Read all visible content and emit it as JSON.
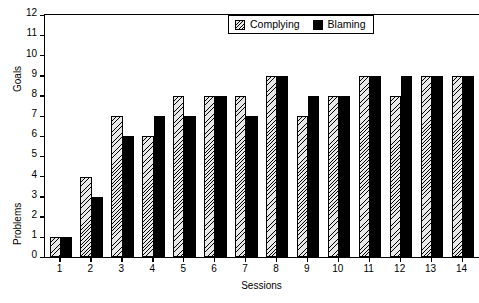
{
  "chart_data": {
    "type": "bar",
    "title": "",
    "xlabel": "Sessions",
    "ylabel": "Goals",
    "ylabel_secondary": "Problems",
    "categories": [
      "1",
      "2",
      "3",
      "4",
      "5",
      "6",
      "7",
      "8",
      "9",
      "10",
      "11",
      "12",
      "13",
      "14"
    ],
    "series": [
      {
        "name": "Complying",
        "values": [
          1,
          4,
          7,
          6,
          8,
          8,
          8,
          9,
          7,
          8,
          9,
          8,
          9,
          9
        ],
        "fill": "hatched",
        "color": "#e8e8e8"
      },
      {
        "name": "Blaming",
        "values": [
          1,
          3,
          6,
          7,
          7,
          8,
          7,
          9,
          8,
          8,
          9,
          9,
          9,
          9
        ],
        "fill": "solid",
        "color": "#000000"
      }
    ],
    "ylim": [
      0,
      12
    ],
    "ytick_labels": [
      "0",
      "1",
      "2",
      "3",
      "4",
      "5",
      "6",
      "7",
      "8",
      "9",
      "10",
      "11",
      "12"
    ],
    "grid": false,
    "legend_position": "top-right",
    "axis_color": "#000000",
    "background": "#ffffff"
  },
  "legend": {
    "items": [
      {
        "label": "Complying"
      },
      {
        "label": "Blaming"
      }
    ]
  }
}
